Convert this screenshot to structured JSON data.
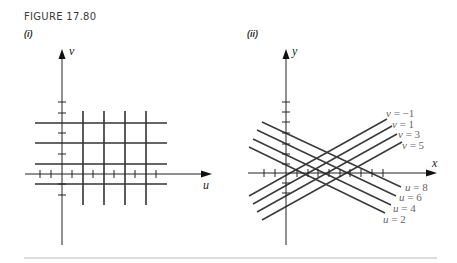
{
  "figure": {
    "title": "FIGURE 17.80",
    "panels": [
      {
        "id": "i",
        "label": "(i)"
      },
      {
        "id": "ii",
        "label": "(ii)"
      }
    ]
  },
  "chart_data": [
    {
      "type": "diagram",
      "title": "(i)",
      "description": "Rectangular grid in the uv-plane",
      "axes": {
        "horizontal": "u",
        "vertical": "v"
      },
      "vertical_lines_u": [
        2,
        4,
        6,
        8
      ],
      "horizontal_lines_v": [
        -1,
        1,
        3,
        5
      ],
      "svg": {
        "axis_color": "#222222",
        "line_color": "#333333",
        "v_axis": {
          "x": 62,
          "y1": 245,
          "y2": 49,
          "label": "v",
          "label_x": 69,
          "label_y": 55
        },
        "u_axis": {
          "y": 174,
          "x1": 25,
          "x2": 212,
          "label": "u",
          "label_x": 203,
          "label_y": 189
        },
        "v_ticks": [
          102,
          113,
          133,
          154,
          184,
          195
        ],
        "u_ticks": [
          40,
          51,
          72,
          93,
          114,
          135,
          156
        ],
        "grid_vertical_x": [
          83,
          104,
          125,
          146
        ],
        "grid_vertical_y": [
          111,
          205
        ],
        "grid_horizontal_y": [
          123,
          143,
          164,
          184
        ],
        "grid_horizontal_x": [
          35,
          167
        ]
      }
    },
    {
      "type": "diagram",
      "title": "(ii)",
      "description": "Image of the grid in the xy-plane: two families of slanted parallel lines",
      "axes": {
        "horizontal": "x",
        "vertical": "y"
      },
      "svg": {
        "y_axis": {
          "x": 286,
          "y1": 245,
          "y2": 49,
          "label": "y",
          "label_x": 292,
          "label_y": 55
        },
        "x_axis": {
          "y": 173,
          "x1": 248,
          "x2": 437,
          "label": "x",
          "label_x": 432,
          "label_y": 167
        },
        "y_ticks": [
          102,
          112,
          122,
          133,
          144,
          154,
          164,
          183,
          193
        ],
        "x_ticks": [
          264,
          275,
          297,
          308,
          318,
          329,
          340,
          350,
          361,
          372,
          383
        ],
        "u_lines": [
          {
            "label": "u = 8",
            "x1": 262,
            "y1": 122,
            "x2": 401,
            "y2": 187,
            "label_x": 405,
            "label_y": 191
          },
          {
            "label": "u = 6",
            "x1": 257,
            "y1": 130,
            "x2": 396,
            "y2": 196,
            "label_x": 399,
            "label_y": 201
          },
          {
            "label": "u = 4",
            "x1": 253,
            "y1": 139,
            "x2": 391,
            "y2": 205,
            "label_x": 393,
            "label_y": 212
          },
          {
            "label": "u = 2",
            "x1": 249,
            "y1": 147,
            "x2": 385,
            "y2": 213,
            "label_x": 383,
            "label_y": 223
          }
        ],
        "v_lines": [
          {
            "label": "v = −1",
            "x1": 249,
            "y1": 196,
            "x2": 387,
            "y2": 119,
            "label_x": 386,
            "label_y": 117
          },
          {
            "label": "v = 1",
            "x1": 253,
            "y1": 204,
            "x2": 392,
            "y2": 126,
            "label_x": 392,
            "label_y": 128
          },
          {
            "label": "v = 3",
            "x1": 257,
            "y1": 212,
            "x2": 397,
            "y2": 134,
            "label_x": 398,
            "label_y": 138
          },
          {
            "label": "v = 5",
            "x1": 262,
            "y1": 220,
            "x2": 402,
            "y2": 142,
            "label_x": 402,
            "label_y": 149
          }
        ]
      }
    }
  ],
  "footer_rule": {
    "x1": 24,
    "x2": 437,
    "y": 258,
    "color": "#bbbbbb"
  }
}
